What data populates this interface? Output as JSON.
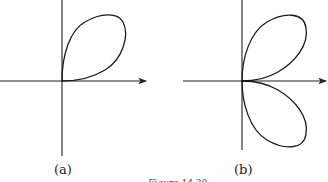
{
  "figures": [
    {
      "label": "(a)",
      "description": "Single-leaf polar curve in the first quadrant, tangent to both axes at the origin"
    },
    {
      "label": "(b)",
      "description": "Two-leaf polar curve symmetric about the horizontal axis, tangent to the vertical axis at the origin"
    }
  ],
  "caption": "Figure 14.20"
}
